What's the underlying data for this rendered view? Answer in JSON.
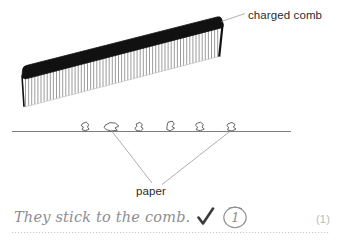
{
  "diagram": {
    "title_alt": "charged comb attracting paper pieces",
    "labels": {
      "charged_comb": "charged comb",
      "paper": "paper"
    },
    "colors": {
      "ink": "#2b2b2b",
      "comb_spine": "#111111",
      "comb_teeth": "#8a8a8a",
      "leader_line": "#9a9a9a",
      "ground_line": "#6f6f6f",
      "handwriting": "#8e8e92",
      "check": "#3a3a3a",
      "page_mark": "#b9b9bd",
      "dotted_rule": "#c9c9cd",
      "background": "#ffffff"
    },
    "comb": {
      "tooth_count": 58,
      "tilt_note": "tilted up to the right"
    },
    "paper_pieces": {
      "count": 6
    }
  },
  "answer": {
    "handwritten_text": "They stick to the comb.",
    "check_glyph": "check-mark",
    "mark_value": "1",
    "page_mark": "(1)"
  }
}
